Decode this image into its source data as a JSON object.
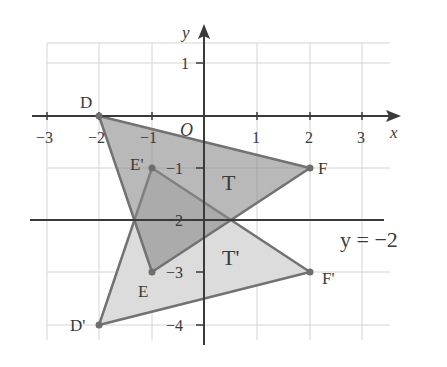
{
  "diagram": {
    "axes": {
      "x_label": "x",
      "y_label": "y",
      "origin_label": "O",
      "x_ticks": [
        {
          "v": -3,
          "label": "−3"
        },
        {
          "v": -2,
          "label": "−2"
        },
        {
          "v": -1,
          "label": "−1"
        },
        {
          "v": 1,
          "label": "1"
        },
        {
          "v": 2,
          "label": "2"
        },
        {
          "v": 3,
          "label": "3"
        }
      ],
      "y_ticks": [
        {
          "v": 1,
          "label": "1"
        },
        {
          "v": -1,
          "label": "−1"
        },
        {
          "v": -2,
          "label": "−2"
        },
        {
          "v": -3,
          "label": "−3"
        },
        {
          "v": -4,
          "label": "−4"
        }
      ],
      "x_range": [
        -3.5,
        3.6
      ],
      "y_range": [
        -4.2,
        1.7
      ],
      "grid": true
    },
    "mirror_line": {
      "equation": "y = −2",
      "y": -2
    },
    "triangles": [
      {
        "name": "T",
        "vertices": [
          {
            "label": "D",
            "x": -2,
            "y": 0
          },
          {
            "label": "E",
            "x": -1,
            "y": -3
          },
          {
            "label": "F",
            "x": 2,
            "y": -1
          }
        ],
        "fill": "#a9a9a9"
      },
      {
        "name": "T'",
        "vertices": [
          {
            "label": "D'",
            "x": -2,
            "y": -4
          },
          {
            "label": "E'",
            "x": -1,
            "y": -1
          },
          {
            "label": "F'",
            "x": 2,
            "y": -3
          }
        ],
        "fill": "#d9d9d9"
      }
    ],
    "colors": {
      "axis": "#3a3a3a",
      "grid": "#d0d0d0",
      "edge": "#6e6e6e",
      "overlap_fill": "#8f8f8f"
    }
  }
}
